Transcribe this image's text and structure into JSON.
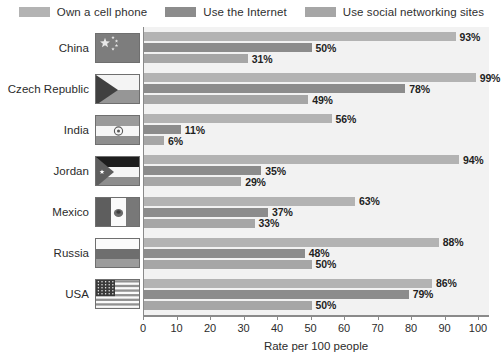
{
  "legend": {
    "items": [
      {
        "label": "Own a cell phone",
        "color": "#b3b3b3",
        "icon": "legend-swatch-own-cell-phone"
      },
      {
        "label": "Use the Internet",
        "color": "#8c8c8c",
        "icon": "legend-swatch-use-internet"
      },
      {
        "label": "Use social networking sites",
        "color": "#a6a6a6",
        "icon": "legend-swatch-social-networking"
      }
    ]
  },
  "chart_data": {
    "type": "bar",
    "orientation": "horizontal",
    "title": "",
    "xlabel": "Rate per 100 people",
    "ylabel": "",
    "xlim": [
      0,
      100
    ],
    "xticks": [
      0,
      10,
      20,
      30,
      40,
      50,
      60,
      70,
      80,
      90,
      100
    ],
    "grid": false,
    "legend_position": "top",
    "categories": [
      "China",
      "Czech Republic",
      "India",
      "Jordan",
      "Mexico",
      "Russia",
      "USA"
    ],
    "series": [
      {
        "name": "Own a cell phone",
        "color": "#b3b3b3",
        "values": [
          93,
          99,
          56,
          94,
          63,
          88,
          86
        ],
        "labels": [
          "93%",
          "99%",
          "56%",
          "94%",
          "63%",
          "88%",
          "86%"
        ]
      },
      {
        "name": "Use the Internet",
        "color": "#8c8c8c",
        "values": [
          50,
          78,
          11,
          35,
          37,
          48,
          79
        ],
        "labels": [
          "50%",
          "78%",
          "11%",
          "35%",
          "37%",
          "48%",
          "79%"
        ]
      },
      {
        "name": "Use social networking sites",
        "color": "#a6a6a6",
        "values": [
          31,
          49,
          6,
          29,
          33,
          50,
          50
        ],
        "labels": [
          "31%",
          "49%",
          "6%",
          "29%",
          "33%",
          "50%",
          "50%"
        ]
      }
    ]
  },
  "flags": [
    {
      "country": "China",
      "icon": "flag-icon-china"
    },
    {
      "country": "Czech Republic",
      "icon": "flag-icon-czech-republic"
    },
    {
      "country": "India",
      "icon": "flag-icon-india"
    },
    {
      "country": "Jordan",
      "icon": "flag-icon-jordan"
    },
    {
      "country": "Mexico",
      "icon": "flag-icon-mexico"
    },
    {
      "country": "Russia",
      "icon": "flag-icon-russia"
    },
    {
      "country": "USA",
      "icon": "flag-icon-usa"
    }
  ],
  "colors": {
    "plot_background": "#f2f2f2",
    "axis": "#8a8a8a",
    "text": "#2b2b2b"
  }
}
